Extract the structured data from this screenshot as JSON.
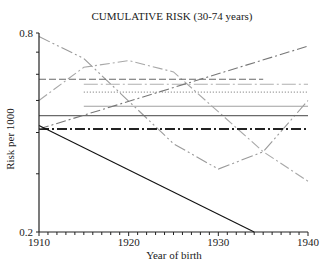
{
  "chart_data": {
    "type": "line",
    "title": "CUMULATIVE RISK (30-74 years)",
    "xlabel": "Year of birth",
    "ylabel": "Risk per 1000",
    "xlim": [
      1910,
      1940
    ],
    "ylim": [
      0.2,
      0.8
    ],
    "yscale": "log",
    "x_ticks": [
      1910,
      1920,
      1930,
      1940
    ],
    "x_minor_tick_step": 1,
    "y_tick_labels": [
      "0.8",
      "0.2"
    ],
    "y_ticks": [
      0.8,
      0.7,
      0.6,
      0.5,
      0.4,
      0.3,
      0.2
    ],
    "grid": false,
    "legend": null,
    "series": [
      {
        "name": "series-1",
        "style": "long-dash-double-dot",
        "color": "#9a9a9a",
        "x": [
          1910,
          1915,
          1925,
          1930,
          1935,
          1940
        ],
        "values": [
          0.78,
          0.67,
          0.37,
          0.31,
          0.35,
          0.5
        ]
      },
      {
        "name": "series-2",
        "style": "dash-dot",
        "color": "#a8a8a8",
        "x": [
          1910,
          1915,
          1920,
          1925,
          1935,
          1940
        ],
        "values": [
          0.5,
          0.63,
          0.66,
          0.61,
          0.35,
          0.285
        ]
      },
      {
        "name": "series-3",
        "style": "dashed",
        "color": "#6a6a6a",
        "x": [
          1910,
          1935
        ],
        "values": [
          0.58,
          0.58
        ]
      },
      {
        "name": "series-4",
        "style": "dash-dot-light",
        "color": "#b0b0b0",
        "x": [
          1915,
          1940
        ],
        "values": [
          0.56,
          0.56
        ]
      },
      {
        "name": "series-5",
        "style": "dotted",
        "color": "#8a8a8a",
        "x": [
          1915,
          1940
        ],
        "values": [
          0.53,
          0.53
        ]
      },
      {
        "name": "series-6",
        "style": "solid",
        "color": "#a0a0a0",
        "x": [
          1915,
          1940
        ],
        "values": [
          0.48,
          0.48
        ]
      },
      {
        "name": "series-7",
        "style": "solid",
        "color": "#6a6a6a",
        "x": [
          1910,
          1940
        ],
        "values": [
          0.45,
          0.45
        ]
      },
      {
        "name": "series-8",
        "style": "thick-dash-dot",
        "color": "#222222",
        "x": [
          1910,
          1940
        ],
        "values": [
          0.41,
          0.41
        ]
      },
      {
        "name": "series-9",
        "style": "dash-dot",
        "color": "#777777",
        "x": [
          1910,
          1940
        ],
        "values": [
          0.41,
          0.73
        ]
      },
      {
        "name": "series-10",
        "style": "solid",
        "color": "#111111",
        "x": [
          1910,
          1934
        ],
        "values": [
          0.42,
          0.2
        ]
      }
    ]
  }
}
